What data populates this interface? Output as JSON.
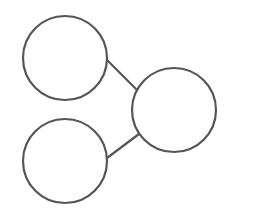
{
  "diagram": {
    "width": 274,
    "height": 213,
    "background": "#ffffff",
    "stroke_color": "#555555",
    "stroke_width": 2.2,
    "nodes": [
      {
        "id": "top-left",
        "cx": 65,
        "cy": 58,
        "r": 42,
        "fill": "#ffffff"
      },
      {
        "id": "bottom-left",
        "cx": 65,
        "cy": 161,
        "r": 42,
        "fill": "#ffffff"
      },
      {
        "id": "right",
        "cx": 174,
        "cy": 110,
        "r": 42,
        "fill": "#ffffff"
      }
    ],
    "edges": [
      {
        "from": "top-left",
        "to": "right",
        "x1": 106,
        "y1": 59,
        "x2": 138,
        "y2": 91
      },
      {
        "from": "bottom-left",
        "to": "right",
        "x1": 107,
        "y1": 158,
        "x2": 139,
        "y2": 134
      }
    ]
  }
}
